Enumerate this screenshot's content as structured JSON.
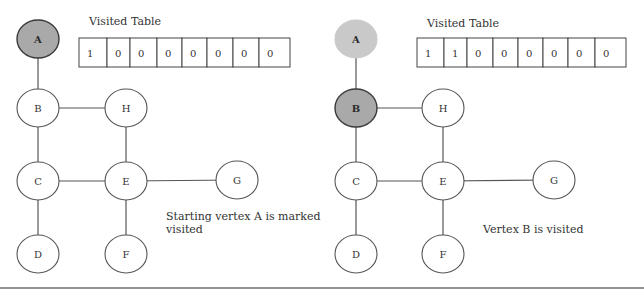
{
  "panels": [
    {
      "id": "step1",
      "offset_x": 0,
      "table": {
        "title": "Visited Table",
        "title_pos": [
          89,
          25
        ],
        "x": 79,
        "y": 38,
        "height": 29,
        "cell_edges": [
          79,
          107,
          130,
          157,
          182,
          207,
          233,
          259,
          290
        ],
        "values": [
          "1",
          "0",
          "0",
          "0",
          "0",
          "0",
          "0",
          "0"
        ]
      },
      "nodes": [
        {
          "id": "A",
          "label": "A",
          "cx": 38,
          "cy": 39,
          "state": "visited"
        },
        {
          "id": "B",
          "label": "B",
          "cx": 38,
          "cy": 108,
          "state": "unvisited"
        },
        {
          "id": "H",
          "label": "H",
          "cx": 126,
          "cy": 108,
          "state": "unvisited"
        },
        {
          "id": "C",
          "label": "C",
          "cx": 38,
          "cy": 181,
          "state": "unvisited"
        },
        {
          "id": "E",
          "label": "E",
          "cx": 126,
          "cy": 181,
          "state": "unvisited"
        },
        {
          "id": "G",
          "label": "G",
          "cx": 237,
          "cy": 180,
          "state": "unvisited"
        },
        {
          "id": "D",
          "label": "D",
          "cx": 38,
          "cy": 254,
          "state": "unvisited"
        },
        {
          "id": "F",
          "label": "F",
          "cx": 126,
          "cy": 254,
          "state": "unvisited"
        }
      ],
      "caption": {
        "lines": [
          "Starting vertex A is marked",
          "visited"
        ],
        "x": 166,
        "y": 220,
        "line_height": 13
      }
    },
    {
      "id": "step2",
      "offset_x": 0,
      "table": {
        "title": "Visited Table",
        "title_pos": [
          427,
          27
        ],
        "x": 417,
        "y": 38,
        "height": 29,
        "cell_edges": [
          417,
          444,
          467,
          493,
          518,
          543,
          568,
          595,
          626
        ],
        "values": [
          "1",
          "1",
          "0",
          "0",
          "0",
          "0",
          "0",
          "0"
        ]
      },
      "nodes": [
        {
          "id": "A",
          "label": "A",
          "cx": 356,
          "cy": 39,
          "state": "prev-visited"
        },
        {
          "id": "B",
          "label": "B",
          "cx": 356,
          "cy": 108,
          "state": "visited"
        },
        {
          "id": "H",
          "label": "H",
          "cx": 443,
          "cy": 108,
          "state": "unvisited"
        },
        {
          "id": "C",
          "label": "C",
          "cx": 356,
          "cy": 181,
          "state": "unvisited"
        },
        {
          "id": "E",
          "label": "E",
          "cx": 443,
          "cy": 181,
          "state": "unvisited"
        },
        {
          "id": "G",
          "label": "G",
          "cx": 554,
          "cy": 180,
          "state": "unvisited"
        },
        {
          "id": "D",
          "label": "D",
          "cx": 356,
          "cy": 254,
          "state": "unvisited"
        },
        {
          "id": "F",
          "label": "F",
          "cx": 443,
          "cy": 254,
          "state": "unvisited"
        }
      ],
      "caption": {
        "lines": [
          "Vertex B is visited"
        ],
        "x": 483,
        "y": 233,
        "line_height": 13
      }
    }
  ],
  "edges": [
    [
      "A",
      "B"
    ],
    [
      "B",
      "H"
    ],
    [
      "B",
      "C"
    ],
    [
      "H",
      "E"
    ],
    [
      "C",
      "E"
    ],
    [
      "E",
      "G"
    ],
    [
      "C",
      "D"
    ],
    [
      "E",
      "F"
    ]
  ],
  "node_radius": {
    "rx": 21,
    "ry": 19
  },
  "divider": {
    "y": 288,
    "x1": 0,
    "x2": 644
  },
  "colors": {
    "visited_fill": "#a9a9a9",
    "prev_visited_fill": "#c9c9c9",
    "unvisited_fill": "#ffffff",
    "stroke": "#555555"
  }
}
